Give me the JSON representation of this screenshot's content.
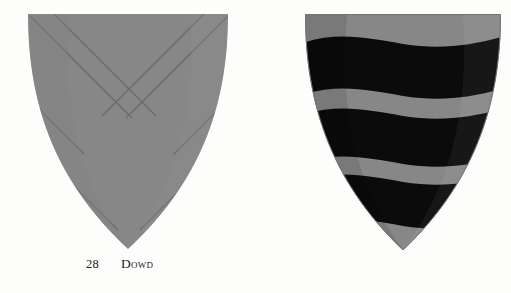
{
  "page": {
    "background_color": "#fdfdfb",
    "width": 511,
    "height": 293,
    "type": "heraldic-plate"
  },
  "palette": {
    "field_gray": "#878787",
    "charge_black": "#0b0b0b",
    "outline_gray": "#6f6f6f",
    "caption_text": "#1c1c1c",
    "highlight_gray": "#9a9a9a"
  },
  "entries": [
    {
      "number": "28",
      "name": "Dowd",
      "blazon_shape": "saltire",
      "tincture_field": "#878787",
      "tincture_charge": "#878787",
      "caption": "28    Dowd"
    },
    {
      "number": "29",
      "name": "Drummond",
      "blazon_shape": "barry-wavy",
      "tincture_field": "#878787",
      "tincture_charge": "#0b0b0b",
      "bar_count": "3",
      "caption": "29    Drummond"
    }
  ]
}
